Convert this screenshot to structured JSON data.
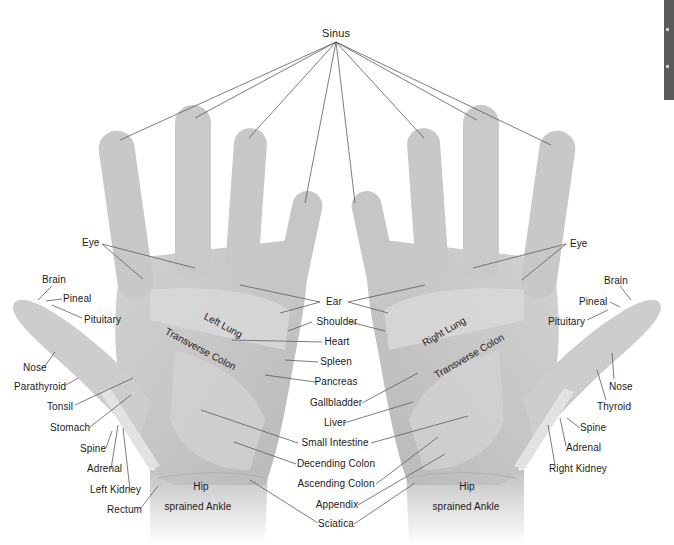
{
  "diagram": {
    "top_label": "Sinus",
    "left_hand": {
      "side_labels_left": [
        "Eye",
        "Brain",
        "Pineal",
        "Pituitary",
        "Nose",
        "Parathyroid",
        "Tonsil",
        "Stomach",
        "Spine",
        "Adrenal",
        "Left Kidney",
        "Rectum"
      ],
      "palm_labels": [
        "Left Lung",
        "Transverse Colon",
        "Hip",
        "sprained Ankle"
      ]
    },
    "right_hand": {
      "side_labels_right": [
        "Eye",
        "Brain",
        "Pineal",
        "Pituitary",
        "Nose",
        "Thyroid",
        "Spine",
        "Adrenal",
        "Right Kidney"
      ],
      "palm_labels": [
        "Right Lung",
        "Transverse Colon",
        "Hip",
        "sprained Ankle"
      ]
    },
    "center_labels": [
      "Ear",
      "Shoulder",
      "Heart",
      "Spleen",
      "Pancreas",
      "Gallbladder",
      "Liver",
      "Small Intestine",
      "Decending Colon",
      "Ascending Colon",
      "Appendix",
      "Sciatica"
    ],
    "colors": {
      "background": "#ffffff",
      "skin": "#c9c9c9",
      "skin_light": "#dcdcdc",
      "line": "#555555",
      "text": "#1a1a1a"
    }
  }
}
